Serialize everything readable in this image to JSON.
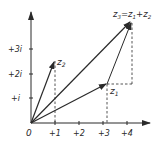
{
  "diagram": {
    "type": "complex-plane-vector-addition",
    "axes": {
      "origin_label": "0",
      "x_ticks": [
        "+1",
        "+2",
        "+3",
        "+4"
      ],
      "y_ticks": [
        "+i",
        "+2i",
        "+3i"
      ]
    },
    "vectors": [
      {
        "name": "z1",
        "label_main": "z",
        "label_sub": "1",
        "re": 3.2,
        "im": 1.6
      },
      {
        "name": "z2",
        "label_main": "z",
        "label_sub": "2",
        "re": 1.0,
        "im": 2.5
      },
      {
        "name": "z3",
        "label": "z3 = z1 + z2",
        "re": 4.2,
        "im": 4.1
      }
    ],
    "z3_label": {
      "z3": "z",
      "z3_sub": "3",
      "eq": "=",
      "z1": "z",
      "z1_sub": "1",
      "plus": "+",
      "z2": "z",
      "z2_sub": "2"
    },
    "colors": {
      "ink": "#2a2a2a",
      "background": "#ffffff"
    }
  }
}
